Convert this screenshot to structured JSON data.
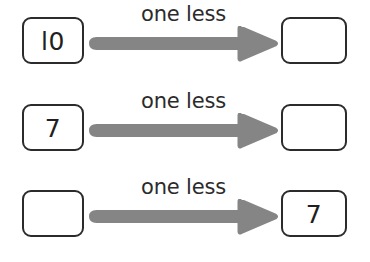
{
  "worksheet": {
    "title": "one less number pattern worksheet",
    "arrow_color": "#858585",
    "box_border_color": "#2b2b2b",
    "text_color": "#2b2b2b",
    "background_color": "#ffffff",
    "rows": [
      {
        "left_value": "l0",
        "label": "one less",
        "right_value": "",
        "arrow_direction": "right"
      },
      {
        "left_value": "7",
        "label": "one less",
        "right_value": "",
        "arrow_direction": "right"
      },
      {
        "left_value": "",
        "label": "one less",
        "right_value": "7",
        "arrow_direction": "right"
      }
    ]
  }
}
